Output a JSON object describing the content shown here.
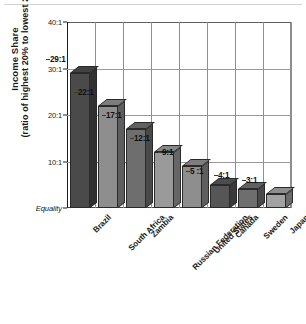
{
  "chart_data": {
    "type": "bar",
    "title": "",
    "xlabel": "",
    "ylabel": "Income Share (ratio of highest 20% to lowest 20%)",
    "ylabel_line1": "Income Share",
    "ylabel_line2": "(ratio of highest 20% to lowest 20%)",
    "categories": [
      "Brazil",
      "South Africa",
      "Zambia",
      "Russian Federation",
      "United States",
      "Canada",
      "Sweden",
      "Japan"
    ],
    "values": [
      29,
      22,
      17,
      12,
      9,
      5,
      4,
      3
    ],
    "data_labels": [
      "29:1",
      "22:1",
      "17:1",
      "12:1",
      "9:1",
      "5 :1",
      "4:1",
      "3:1"
    ],
    "ylim": [
      0,
      40
    ],
    "yticks": [
      40,
      30,
      20,
      10,
      0
    ],
    "ytick_labels": [
      "40:1",
      "30:1",
      "20:1",
      "10:1",
      "Equality"
    ],
    "baseline_label": "Equality",
    "grid": "vertical-category-separators",
    "legend": "none",
    "bar_colors": [
      "#4a4a4a",
      "#8e8e8e",
      "#6e6e6e",
      "#9a9a9a",
      "#8e8e8e",
      "#565656",
      "#6e6e6e",
      "#a2a2a2"
    ]
  }
}
